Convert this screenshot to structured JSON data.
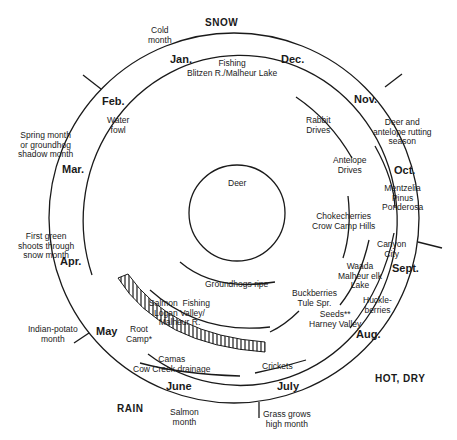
{
  "diagram": {
    "seasons": {
      "top": "SNOW",
      "bottom_left": "RAIN",
      "bottom_right": "HOT, DRY"
    },
    "months": [
      {
        "key": "jan",
        "label": "Jan."
      },
      {
        "key": "feb",
        "label": "Feb."
      },
      {
        "key": "mar",
        "label": "Mar."
      },
      {
        "key": "apr",
        "label": "Apr."
      },
      {
        "key": "may",
        "label": "May"
      },
      {
        "key": "june",
        "label": "June"
      },
      {
        "key": "july",
        "label": "July"
      },
      {
        "key": "aug",
        "label": "Aug."
      },
      {
        "key": "sept",
        "label": "Sept."
      },
      {
        "key": "oct",
        "label": "Oct."
      },
      {
        "key": "nov",
        "label": "Nov."
      },
      {
        "key": "dec",
        "label": "Dec."
      }
    ],
    "month_names": [
      {
        "key": "cold",
        "label": "Cold\nmonth"
      },
      {
        "key": "spring",
        "label": "Spring month\nor groundhog\nshadow month"
      },
      {
        "key": "green",
        "label": "First green\nshoots through\nsnow month"
      },
      {
        "key": "potato",
        "label": "Indian-potato\nmonth"
      },
      {
        "key": "salmon",
        "label": "Salmon\nmonth"
      },
      {
        "key": "grass",
        "label": "Grass grows\nhigh month"
      },
      {
        "key": "rutting",
        "label": "Deer and\nantelope rutting\nseason"
      }
    ],
    "activities": [
      {
        "key": "fishing",
        "label": "Fishing\nBlitzen R./Malheur Lake"
      },
      {
        "key": "waterfowl",
        "label": "Water\nfowl"
      },
      {
        "key": "rabbit",
        "label": "Rabbit\nDrives"
      },
      {
        "key": "antelope",
        "label": "Antelope\nDrives"
      },
      {
        "key": "mentzelia",
        "label": "Mentzelia\nPinus\nPonderosa"
      },
      {
        "key": "chokecherries",
        "label": "Chokecherries\nCrow Camp Hills"
      },
      {
        "key": "canyon",
        "label": "Canyon\nCity"
      },
      {
        "key": "waada",
        "label": "Waada\nMalheur elk\nLake"
      },
      {
        "key": "buckberries",
        "label": "Buckberries\nTule Spr."
      },
      {
        "key": "seeds",
        "label": "Seeds**\nHarney Valley"
      },
      {
        "key": "huckleberries",
        "label": "Huckle-\nberries"
      },
      {
        "key": "groundhogs",
        "label": "Groundhogs ripe"
      },
      {
        "key": "salmon_fishing",
        "label": "Salmon  Fishing\nLogan Valley/\nMalheur R."
      },
      {
        "key": "root_camp",
        "label": "Root\nCamp*"
      },
      {
        "key": "camas",
        "label": "Camas\nCow Creek drainage"
      },
      {
        "key": "crickets",
        "label": "Crickets"
      },
      {
        "key": "deer",
        "label": "Deer"
      }
    ],
    "colors": {
      "ink": "#1a1a1a",
      "background": "#ffffff"
    }
  }
}
